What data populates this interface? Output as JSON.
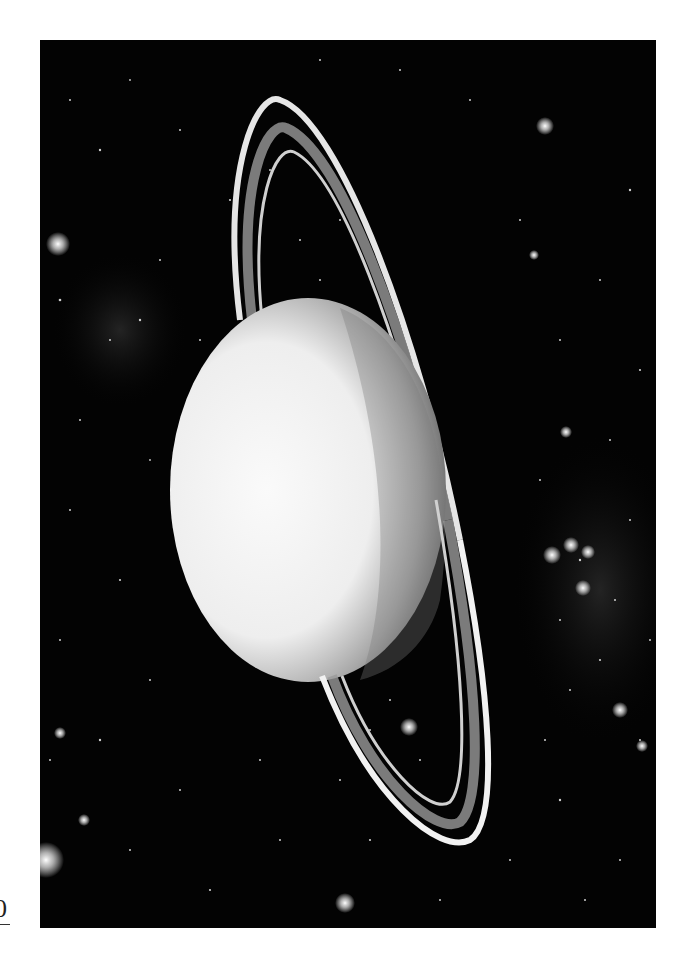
{
  "image": {
    "subject": "Ringed planet (Uranus-style) with thin bright rings against a star field",
    "alt": "Black-and-white photograph of a ringed planet with stars",
    "colors": {
      "background_page": "#ffffff",
      "space": "#030303",
      "planet_light": "#f4f4f4",
      "planet_shadow": "#8a8a8a",
      "ring": "#e8e8e8"
    }
  },
  "margin": {
    "mark": "0"
  }
}
